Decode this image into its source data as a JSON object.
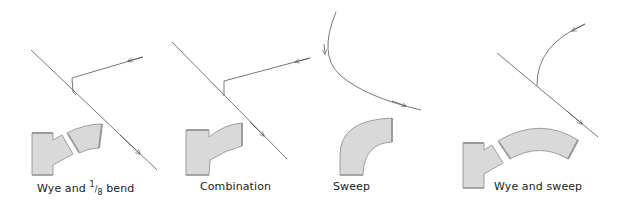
{
  "figure": {
    "panels": [
      {
        "id": "wye-eighth-bend",
        "caption_pre": "Wye and ",
        "caption_num": "1",
        "caption_den": "8",
        "caption_post": " bend"
      },
      {
        "id": "combination",
        "caption": "Combination"
      },
      {
        "id": "sweep",
        "caption": "Sweep"
      },
      {
        "id": "wye-sweep",
        "caption": "Wye and sweep"
      }
    ],
    "colors": {
      "fitting_fill": "#d9d9d9",
      "fitting_stroke": "#8a8a8a",
      "fitting_hub": "#9a9a9a",
      "flow_line": "#555555"
    }
  }
}
